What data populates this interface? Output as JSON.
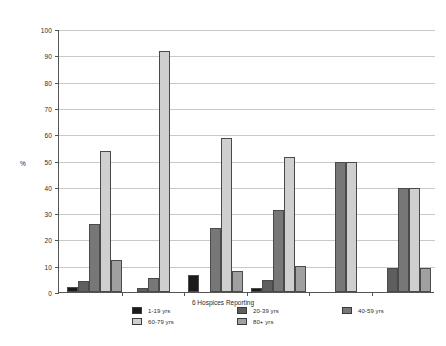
{
  "chart_data": {
    "type": "bar",
    "title": "",
    "xlabel": "6 Hospices Reporting",
    "ylabel": "%",
    "ylim": [
      0,
      100
    ],
    "ytick_step": 10,
    "yticks": [
      0,
      10,
      20,
      30,
      40,
      50,
      60,
      70,
      80,
      90,
      100
    ],
    "grid": true,
    "legend_position": "bottom",
    "categories": [
      "Hospice 1",
      "Hospice 2",
      "Hospice 3",
      "Hospice 4",
      "Hospice 5",
      "Hospice 6"
    ],
    "category_labels_shown": false,
    "series": [
      {
        "name": "1-19 yrs",
        "color": "#1a1a1a",
        "values": [
          2,
          0,
          6.5,
          1.5,
          0,
          0
        ]
      },
      {
        "name": "20-39 yrs",
        "color": "#5e5e5e",
        "values": [
          4,
          1.5,
          0,
          4.5,
          0,
          9
        ]
      },
      {
        "name": "40-59 yrs",
        "color": "#777777",
        "values": [
          26,
          5.5,
          24.5,
          31,
          49.5,
          39.5
        ]
      },
      {
        "name": "60-79 yrs",
        "color": "#cfcfcf",
        "values": [
          53.5,
          91.5,
          58.5,
          51.5,
          49.5,
          39.5
        ]
      },
      {
        "name": "80+ yrs",
        "color": "#a0a0a0",
        "values": [
          12,
          0,
          8,
          10,
          0,
          9
        ]
      }
    ]
  },
  "legend": {
    "items": [
      {
        "label": "1-19 yrs",
        "color": "#1a1a1a"
      },
      {
        "label": "20-39 yrs",
        "color": "#5e5e5e"
      },
      {
        "label": "40-59 yrs",
        "color": "#777777"
      },
      {
        "label": "60-79 yrs",
        "color": "#cfcfcf"
      },
      {
        "label": "80+ yrs",
        "color": "#a0a0a0"
      }
    ]
  },
  "colors": {
    "axis": "#555555",
    "gridline": "#c9c9c9",
    "background": "#ffffff",
    "text": "#2b2b2b"
  }
}
